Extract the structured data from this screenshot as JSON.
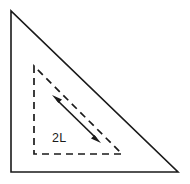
{
  "figure": {
    "background_color": "#ffffff",
    "line_color": "#1a1a1a",
    "outer_triangle": {
      "name": "outer-solid-right-triangle",
      "style": "solid",
      "stroke_width": 1.6,
      "points": "11,11 11,172 178,172",
      "vertices": [
        {
          "label": "apex-top-left",
          "x": 11,
          "y": 11
        },
        {
          "label": "right-angle-bottom-left",
          "x": 11,
          "y": 172
        },
        {
          "label": "bottom-right",
          "x": 178,
          "y": 172
        }
      ]
    },
    "inner_triangle": {
      "name": "inner-dashed-right-triangle",
      "style": "dashed",
      "stroke_width": 1.7,
      "dash_pattern": "7 5",
      "points": "34,66 34,154 122,154",
      "vertices": [
        {
          "label": "apex-top-left",
          "x": 34,
          "y": 66
        },
        {
          "label": "right-angle-bottom-left",
          "x": 34,
          "y": 154
        },
        {
          "label": "bottom-right",
          "x": 122,
          "y": 154
        }
      ]
    },
    "measure_arrow": {
      "name": "double-headed-measure-arrow",
      "style": "solid",
      "stroke_width": 1.7,
      "double_headed": true,
      "start": {
        "x": 52,
        "y": 95
      },
      "end": {
        "x": 101,
        "y": 143
      },
      "label": "2L",
      "label_x": 52,
      "label_y": 142
    }
  }
}
